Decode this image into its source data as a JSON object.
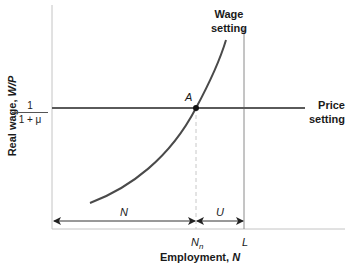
{
  "axes": {
    "y_label_prefix": "Real wage, ",
    "y_label_var": "W/P",
    "x_label_prefix": "Employment, ",
    "x_label_var": "N",
    "y_tick": {
      "numerator": "1",
      "denominator": "1 + μ"
    }
  },
  "curves": {
    "wage_setting_line1": "Wage",
    "wage_setting_line2": "setting",
    "price_setting_line1": "Price",
    "price_setting_line2": "setting"
  },
  "points": {
    "equilibrium": "A"
  },
  "x_ticks": {
    "natural_employment": "N",
    "natural_employment_sub": "n",
    "labor_force": "L"
  },
  "spans": {
    "employment": "N",
    "unemployment": "U"
  },
  "colors": {
    "axis": "#bdbdbd",
    "curve": "#444444",
    "text": "#1a1a1a"
  }
}
